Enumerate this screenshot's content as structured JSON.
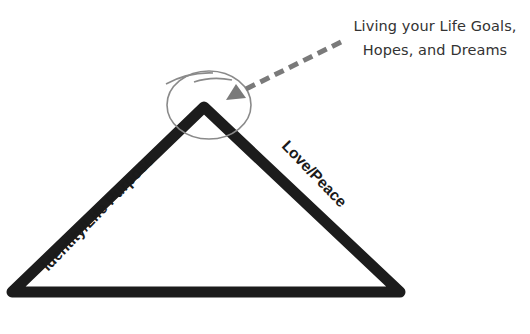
{
  "diagram": {
    "type": "triangle-concept",
    "callout": {
      "line1": "Living your Life Goals,",
      "line2": "Hopes, and Dreams"
    },
    "sides": {
      "left": "Identity/Life Purpose",
      "right": "Love/Peace"
    },
    "colors": {
      "triangle_stroke": "#1c1c1c",
      "circle_stroke": "#8a8a8a",
      "arrow": "#7a7a7a",
      "text": "#333333",
      "background": "#ffffff"
    }
  }
}
